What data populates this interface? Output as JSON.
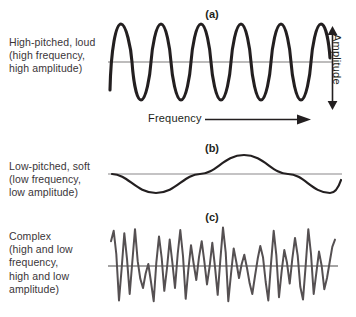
{
  "figure": {
    "background_color": "#ffffff",
    "ink_color": "#231f20",
    "complex_wave_color": "#555052",
    "baseline_color": "#7d7a7b"
  },
  "panels": [
    {
      "letter": "(a)",
      "description_lines": [
        "High-pitched, loud",
        "(high frequency,",
        "high amplitude)"
      ],
      "axis_labels": {
        "x": "Frequency",
        "y": "Amplitude"
      }
    },
    {
      "letter": "(b)",
      "description_lines": [
        "Low-pitched, soft",
        "(low frequency,",
        "low amplitude)"
      ]
    },
    {
      "letter": "(c)",
      "description_lines": [
        "Complex",
        "(high and low",
        "frequency,",
        "high and low",
        "amplitude)"
      ]
    }
  ],
  "chart_data": {
    "type": "line",
    "title": "",
    "xlabel": "Frequency",
    "ylabel": "Amplitude",
    "grid": false,
    "legend": "none",
    "series": [
      {
        "name": "(a) High-pitched, loud — high frequency, high amplitude",
        "waveform": "sine",
        "cycles": 11,
        "amplitude": 1.0,
        "baseline": 0,
        "x_range": [
          0,
          11
        ],
        "ylim": [
          -1.15,
          1.15
        ],
        "color": "#231f20"
      },
      {
        "name": "(b) Low-pitched, soft — low frequency, low amplitude",
        "waveform": "sine",
        "cycles": 1.5,
        "amplitude": 0.42,
        "phase": "starts downward",
        "baseline": 0,
        "x_range": [
          0,
          1.5
        ],
        "ylim": [
          -1.15,
          1.15
        ],
        "color": "#231f20"
      },
      {
        "name": "(c) Complex — high and low frequency, high and low amplitude",
        "waveform": "complex",
        "baseline": 0,
        "ylim": [
          -1.15,
          1.15
        ],
        "color": "#555052",
        "values": [
          0.62,
          0.88,
          0.3,
          -0.86,
          -0.05,
          0.82,
          0.18,
          -0.7,
          0.1,
          0.92,
          0.12,
          -0.32,
          -0.55,
          -0.18,
          0.05,
          -0.4,
          -0.88,
          0.08,
          0.74,
          0.2,
          -0.62,
          -0.05,
          0.66,
          0.1,
          -0.55,
          0.3,
          0.9,
          0.25,
          -0.82,
          -0.1,
          0.52,
          0.05,
          -0.35,
          0.22,
          0.62,
          0.12,
          -0.46,
          0.0,
          0.58,
          -0.02,
          -0.72,
          0.14,
          0.96,
          0.34,
          -0.88,
          -0.2,
          0.44,
          0.1,
          -0.3,
          0.05,
          0.28,
          -0.05,
          -0.44,
          -0.7,
          -0.25,
          0.18,
          0.5,
          0.22,
          -0.4,
          -0.86,
          0.06,
          0.88,
          0.28,
          -0.78,
          -0.12,
          0.4,
          0.08,
          -0.44,
          0.18,
          0.7,
          0.26,
          -0.52,
          -0.84,
          0.02,
          0.92,
          0.3,
          -0.7,
          -0.18,
          0.36,
          0.0,
          -0.58,
          -0.3,
          0.1,
          0.48,
          0.66
        ]
      }
    ]
  }
}
